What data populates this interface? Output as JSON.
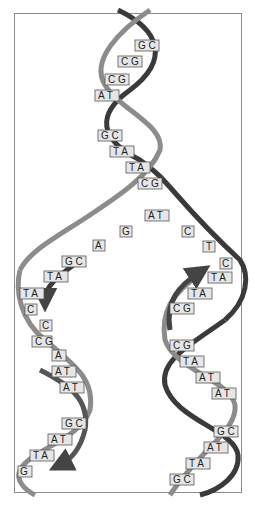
{
  "diagram": {
    "colors": {
      "strand_dark": "#3a3a3a",
      "strand_light": "#8c8c8c",
      "base_box_fill": "#e6e6e6",
      "base_box_stroke": "#555555",
      "frame": "#8a8a8a"
    },
    "parent_helix": {
      "base_pairs": [
        "G C",
        "C G",
        "C G",
        "A T",
        "G C",
        "T A",
        "T A",
        "C G",
        "A T"
      ]
    },
    "unpaired_bases": [
      "G",
      "A",
      "C",
      "T",
      "C"
    ],
    "left_daughter": {
      "base_pairs": [
        "G C",
        "T A",
        "T A",
        "C",
        "C",
        "C G",
        "A",
        "A T",
        "A T",
        "G C",
        "A T",
        "T A",
        "G"
      ],
      "arrow_direction": "down"
    },
    "right_daughter": {
      "base_pairs": [
        "T A",
        "T A",
        "C G",
        "C G",
        "T A",
        "A T",
        "A T",
        "G C",
        "A T",
        "T A",
        "G C"
      ],
      "arrow_direction": "up"
    }
  }
}
